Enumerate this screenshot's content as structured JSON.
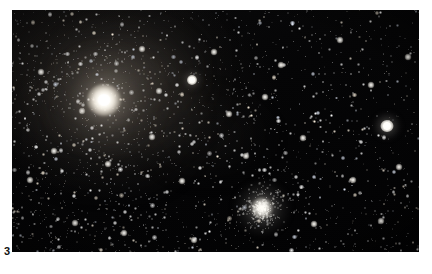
{
  "page": {
    "background_color": "#ffffff",
    "width": 432,
    "height": 274
  },
  "figure": {
    "number_label": "3",
    "caption": "",
    "plate": {
      "x": 12,
      "y": 10,
      "width": 407,
      "height": 242,
      "background_color": "#020203",
      "description": "Wide-field astrophotograph of a dense star field containing a very bright star surrounded by nebulosity, a globular star cluster, and scattered field stars."
    }
  },
  "astro_objects": [
    {
      "name": "antares",
      "label": "bright-star-with-nebulosity",
      "x_pct": 22.6,
      "y_pct": 37.2,
      "brightness": "very-bright",
      "color": "#ffffff"
    },
    {
      "name": "globular-cluster-m4",
      "label": "globular-cluster",
      "x_pct": 61.4,
      "y_pct": 81.8,
      "brightness": "bright-diffuse",
      "color": "#fdfcf8"
    },
    {
      "name": "field-star-right",
      "label": "bright-field-star",
      "x_pct": 92.1,
      "y_pct": 47.9,
      "brightness": "bright",
      "color": "#ffffff"
    },
    {
      "name": "field-star-upper-middle",
      "label": "bright-field-star",
      "x_pct": 44.2,
      "y_pct": 28.9,
      "brightness": "bright",
      "color": "#ffffff"
    }
  ],
  "nebulosity": {
    "label": "diffuse-nebulosity",
    "region": "upper-left-quadrant",
    "color": "#78706a"
  }
}
